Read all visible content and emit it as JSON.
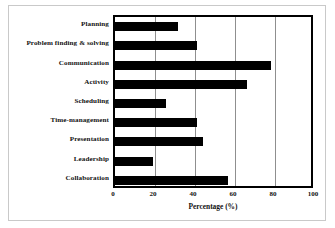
{
  "chart_data": {
    "type": "bar",
    "orientation": "horizontal",
    "title": "",
    "xlabel": "Percentage (%)",
    "ylabel": "",
    "xlim": [
      0,
      100
    ],
    "xticks": [
      0,
      20,
      40,
      60,
      80,
      100
    ],
    "grid": true,
    "legend": false,
    "bar_color": "#000000",
    "plot_background": "#ffffff",
    "axis_color": "#000000",
    "gridline_color": "#8f8f8f",
    "frame_color": "#c9c9c9",
    "categories": [
      "Planning",
      "Problem finding & solving",
      "Communication",
      "Activity",
      "Scheduling",
      "Time-management",
      "Presentation",
      "Leadership",
      "Collaboration"
    ],
    "values": [
      31.5,
      41,
      78,
      66,
      25.5,
      41,
      44,
      19,
      56.5
    ]
  }
}
